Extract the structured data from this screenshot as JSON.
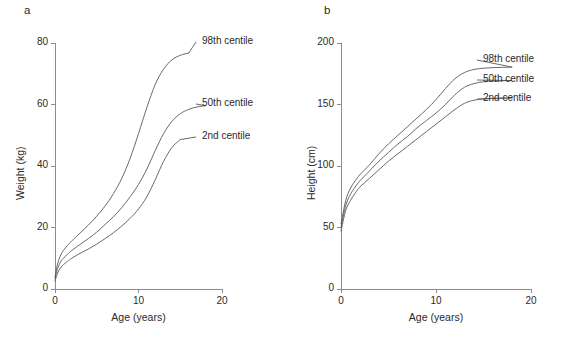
{
  "figure": {
    "width": 583,
    "height": 339,
    "background": "#ffffff",
    "line_color": "#58585a",
    "axis_color": "#8c8c8e",
    "text_color": "#2a2a2a"
  },
  "panels": [
    {
      "key": "a",
      "letter": "a",
      "chart_data": {
        "type": "line",
        "title": "",
        "xlabel": "Age (years)",
        "ylabel": "Weight (kg)",
        "xlim": [
          0,
          20
        ],
        "ylim": [
          0,
          80
        ],
        "xticks": [
          0,
          10,
          20
        ],
        "xticklabels": [
          "0",
          "10",
          "20"
        ],
        "yticks": [
          0,
          20,
          40,
          60,
          80
        ],
        "yticklabels": [
          "0",
          "20",
          "40",
          "60",
          "80"
        ],
        "grid": false,
        "legend_position": "inline-right-of-curve-ends",
        "series": [
          {
            "name": "98th centile",
            "label": "98th centile",
            "x": [
              0,
              0.25,
              0.5,
              0.75,
              1,
              1.5,
              2,
              3,
              4,
              5,
              6,
              7,
              8,
              9,
              10,
              11,
              12,
              13,
              14,
              15,
              16
            ],
            "values": [
              3.9,
              7.5,
              9.8,
              11.4,
              12.5,
              14.2,
              15.6,
              18.2,
              20.8,
              23.7,
              27.0,
              31.0,
              36.0,
              42.5,
              50.5,
              59.0,
              66.5,
              71.5,
              74.5,
              76.0,
              76.7
            ]
          },
          {
            "name": "50th centile",
            "label": "50th centile",
            "x": [
              0,
              0.25,
              0.5,
              0.75,
              1,
              1.5,
              2,
              3,
              4,
              5,
              6,
              7,
              8,
              9,
              10,
              11,
              12,
              13,
              14,
              15,
              16,
              17,
              18
            ],
            "values": [
              3.4,
              6.2,
              7.9,
              9.2,
              10.0,
              11.3,
              12.5,
              14.5,
              16.4,
              18.5,
              21.0,
              23.5,
              26.5,
              30.0,
              34.0,
              39.0,
              45.0,
              50.5,
              54.5,
              57.0,
              58.4,
              59.2,
              59.6
            ]
          },
          {
            "name": "2nd centile",
            "label": "2nd centile",
            "x": [
              0,
              0.25,
              0.5,
              0.75,
              1,
              1.5,
              2,
              3,
              4,
              5,
              6,
              7,
              8,
              9,
              10,
              11,
              12,
              13,
              14,
              15
            ],
            "values": [
              2.5,
              4.7,
              6.2,
              7.2,
              7.9,
              9.0,
              10.0,
              11.6,
              13.0,
              14.6,
              16.4,
              18.3,
              20.5,
              23.0,
              26.0,
              30.0,
              35.5,
              41.5,
              46.0,
              48.6
            ]
          }
        ]
      }
    },
    {
      "key": "b",
      "letter": "b",
      "chart_data": {
        "type": "line",
        "title": "",
        "xlabel": "Age (years)",
        "ylabel": "Height (cm)",
        "xlim": [
          0,
          20
        ],
        "ylim": [
          0,
          200
        ],
        "xticks": [
          0,
          10,
          20
        ],
        "xticklabels": [
          "0",
          "10",
          "20"
        ],
        "yticks": [
          0,
          50,
          100,
          150,
          200
        ],
        "yticklabels": [
          "0",
          "50",
          "100",
          "150",
          "200"
        ],
        "grid": false,
        "legend_position": "inline-right-of-curve-ends",
        "series": [
          {
            "name": "98th centile",
            "label": "98th centile",
            "x": [
              0,
              0.5,
              1,
              1.5,
              2,
              3,
              4,
              5,
              6,
              7,
              8,
              9,
              10,
              11,
              12,
              13,
              14,
              15,
              16,
              17,
              18
            ],
            "values": [
              53,
              72,
              82,
              88,
              93,
              101,
              110,
              118,
              125,
              132,
              139,
              146,
              154,
              163,
              171,
              176,
              178.5,
              179.5,
              180,
              180.2,
              180.4
            ]
          },
          {
            "name": "50th centile",
            "label": "50th centile",
            "x": [
              0,
              0.5,
              1,
              1.5,
              2,
              3,
              4,
              5,
              6,
              7,
              8,
              9,
              10,
              11,
              12,
              13,
              14,
              15,
              16,
              17,
              18
            ],
            "values": [
              50,
              68,
              77,
              83,
              88,
              96,
              104,
              111,
              118,
              124,
              131,
              137,
              143,
              150,
              158,
              164,
              167,
              168.5,
              169,
              169.3,
              169.5
            ]
          },
          {
            "name": "2nd centile",
            "label": "2nd centile",
            "x": [
              0,
              0.5,
              1,
              1.5,
              2,
              3,
              4,
              5,
              6,
              7,
              8,
              9,
              10,
              11,
              12,
              13,
              14,
              15,
              16,
              17,
              18
            ],
            "values": [
              47,
              64,
              72,
              78,
              83,
              90,
              97,
              104,
              110,
              116,
              122,
              128,
              134,
              140,
              146,
              151,
              153.5,
              154.5,
              155,
              155.2,
              155.4
            ]
          }
        ]
      }
    }
  ]
}
